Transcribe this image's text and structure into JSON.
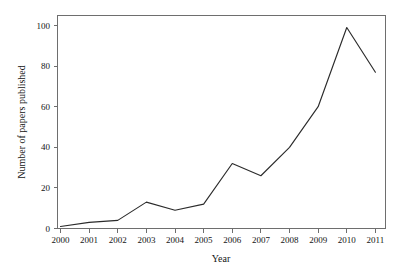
{
  "figure": {
    "background_color": "#ffffff",
    "frame_color": "#6e6e6e",
    "line_color": "#2b2b2b"
  },
  "chart_data": {
    "type": "line",
    "title": "",
    "xlabel": "Year",
    "ylabel": "Number of papers published",
    "categories": [
      "2000",
      "2001",
      "2002",
      "2003",
      "2004",
      "2005",
      "2006",
      "2007",
      "2008",
      "2009",
      "2010",
      "2011"
    ],
    "x": [
      2000,
      2001,
      2002,
      2003,
      2004,
      2005,
      2006,
      2007,
      2008,
      2009,
      2010,
      2011
    ],
    "values": [
      1,
      3,
      4,
      13,
      9,
      12,
      32,
      26,
      40,
      60,
      99,
      77
    ],
    "series": [
      {
        "name": "Number of papers published",
        "values": [
          1,
          3,
          4,
          13,
          9,
          12,
          32,
          26,
          40,
          60,
          99,
          77
        ]
      }
    ],
    "xlim": [
      2000,
      2011
    ],
    "ylim": [
      0,
      104
    ],
    "yticks": [
      0,
      20,
      40,
      60,
      80,
      100
    ],
    "ytick_labels": [
      "0",
      "20",
      "40",
      "60",
      "80",
      "100"
    ],
    "xtick_labels": [
      "2000",
      "2001",
      "2002",
      "2003",
      "2004",
      "2005",
      "2006",
      "2007",
      "2008",
      "2009",
      "2010",
      "2011"
    ],
    "grid": false,
    "legend": false,
    "legend_position": "none",
    "markers": false
  }
}
